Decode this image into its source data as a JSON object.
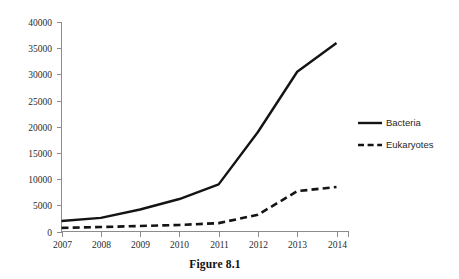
{
  "caption": "Figure 8.1",
  "chart_data": {
    "type": "line",
    "title": "",
    "xlabel": "",
    "ylabel": "",
    "categories": [
      "2007",
      "2008",
      "2009",
      "2010",
      "2011",
      "2012",
      "2013",
      "2014"
    ],
    "x": [
      2007,
      2008,
      2009,
      2010,
      2011,
      2012,
      2013,
      2014
    ],
    "series": [
      {
        "name": "Bacteria",
        "style": "solid",
        "color": "#141414",
        "values": [
          2000,
          2600,
          4200,
          6200,
          9000,
          19000,
          30500,
          36000
        ]
      },
      {
        "name": "Eukaryotes",
        "style": "dashed",
        "color": "#141414",
        "values": [
          700,
          850,
          1050,
          1250,
          1600,
          3200,
          7700,
          8500
        ]
      }
    ],
    "ylim": [
      0,
      40000
    ],
    "ytick_values": [
      0,
      5000,
      10000,
      15000,
      20000,
      25000,
      30000,
      35000,
      40000
    ],
    "ytick_labels": [
      "0",
      "5000",
      "10000",
      "15000",
      "20000",
      "25000",
      "30000",
      "35000",
      "40000"
    ],
    "grid": false,
    "legend_position": "right",
    "legend_entries": [
      "Bacteria",
      "Eukaryotes"
    ],
    "axis_color": "#8c8c8c",
    "background": "#ffffff"
  }
}
